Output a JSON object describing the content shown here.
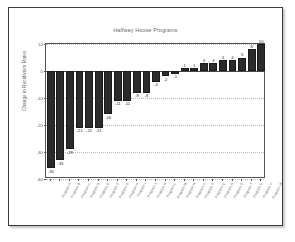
{
  "chart_data": {
    "type": "bar",
    "title": "Halfway House Programs",
    "xlabel": "",
    "ylabel": "Change in Recidivism Rates",
    "ylim": [
      -40,
      10
    ],
    "yticks": [
      10,
      0,
      -10,
      -20,
      -30,
      -40
    ],
    "ytick_labels": [
      "10",
      "0",
      "-10",
      "-20",
      "-30",
      "-40"
    ],
    "grid": true,
    "grid_axis": "y",
    "legend": "none",
    "bar_color": "#2b2b2b",
    "sorted": true,
    "data_labels": true,
    "categories": [
      "Program A",
      "Program B",
      "Program C",
      "Program D",
      "Program E",
      "Program F",
      "Program G",
      "Program H",
      "Program I",
      "Program J",
      "Program K",
      "Program L",
      "Program M",
      "Program N",
      "Program O",
      "Program P",
      "Program Q",
      "Program R",
      "Program S",
      "Program T",
      "Program U",
      "Program V",
      "Program W"
    ],
    "values": [
      -36,
      -33,
      -29,
      -21,
      -21,
      -21,
      -16,
      -11,
      -11,
      -8,
      -8,
      -4,
      -2,
      -1,
      1,
      1,
      3,
      3,
      4,
      4,
      5,
      8,
      10
    ],
    "value_labels": [
      "-36",
      "-33",
      "-29",
      "-21",
      "-21",
      "-21",
      "-16",
      "-11",
      "-11",
      "-8",
      "-8",
      "-4",
      "-2",
      "-1",
      "1",
      "1",
      "3",
      "3",
      "4",
      "4",
      "5",
      "8",
      "10"
    ]
  },
  "colors": {
    "bar": "#2b2b2b",
    "frame": "#3a3a3a",
    "axis": "#555555",
    "grid": "#b9b9b9",
    "text": "#5f5f5f",
    "background": "#ffffff"
  }
}
